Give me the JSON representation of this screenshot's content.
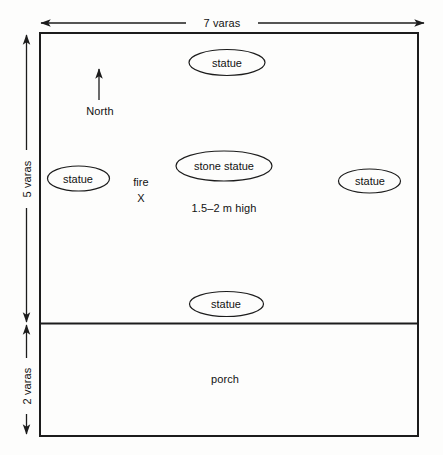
{
  "diagram": {
    "units": "varas",
    "stroke_color": "#1c1c1c",
    "background_color": "#fdfdfc",
    "dimensions": {
      "width_label": "7 varas",
      "main_room_height_label": "5 varas",
      "porch_height_label": "2 varas"
    },
    "compass": {
      "label": "North",
      "direction": "up",
      "icon": "north-arrow-icon"
    },
    "rooms": [
      {
        "id": "main-room",
        "label": ""
      },
      {
        "id": "porch",
        "label": "porch"
      }
    ],
    "features": [
      {
        "id": "fire",
        "label": "fire",
        "marker": "X"
      }
    ],
    "statues": [
      {
        "id": "statue-north",
        "label": "statue",
        "position": "north"
      },
      {
        "id": "statue-west",
        "label": "statue",
        "position": "west"
      },
      {
        "id": "statue-center",
        "label": "stone statue",
        "position": "center"
      },
      {
        "id": "statue-east",
        "label": "statue",
        "position": "east"
      },
      {
        "id": "statue-south",
        "label": "statue",
        "position": "south"
      }
    ],
    "notes": {
      "stone_statue_height": "1.5–2 m high"
    }
  }
}
